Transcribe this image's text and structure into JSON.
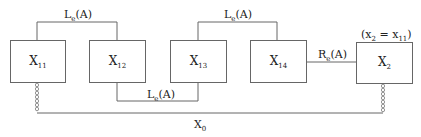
{
  "diagram": {
    "nodes": [
      {
        "id": "X11",
        "main": "X",
        "sub": "11"
      },
      {
        "id": "X12",
        "main": "X",
        "sub": "12"
      },
      {
        "id": "X13",
        "main": "X",
        "sub": "13"
      },
      {
        "id": "X14",
        "main": "X",
        "sub": "14"
      },
      {
        "id": "X2",
        "main": "X",
        "sub": "2"
      }
    ],
    "edges": [
      {
        "from": "X11",
        "to": "X12",
        "label_main": "L",
        "label_sub": "e",
        "label_tail": "(A)",
        "position": "top"
      },
      {
        "from": "X12",
        "to": "X13",
        "label_main": "L",
        "label_sub": "e",
        "label_tail": "(A)",
        "position": "bottom"
      },
      {
        "from": "X13",
        "to": "X14",
        "label_main": "L",
        "label_sub": "e",
        "label_tail": "(A)",
        "position": "top"
      },
      {
        "from": "X14",
        "to": "X2",
        "label_main": "R",
        "label_sub": "e",
        "label_tail": "(A)",
        "position": "middle"
      },
      {
        "from": "X11",
        "to": "X2",
        "label_main": "X",
        "label_sub": "0",
        "label_tail": "",
        "position": "base",
        "style": "chain-link"
      }
    ],
    "annotation": {
      "open": "(x",
      "sub1": "2",
      "mid": " = x",
      "sub2": "11",
      "close": ")"
    }
  }
}
